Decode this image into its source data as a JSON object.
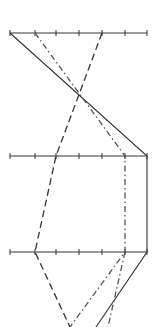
{
  "chart_data": {
    "type": "line",
    "subtype": "parallel-coordinates",
    "title": "",
    "xlabel": "",
    "ylabel": "",
    "grid": false,
    "legend": null,
    "axes": [
      {
        "name": "axis-1",
        "y": 33,
        "ticks": [
          10,
          35,
          56,
          79,
          102,
          125,
          147
        ]
      },
      {
        "name": "axis-2",
        "y": 156,
        "ticks": [
          10,
          35,
          56,
          79,
          102,
          125,
          147
        ]
      },
      {
        "name": "axis-3",
        "y": 252,
        "ticks": [
          10,
          35,
          56,
          79,
          102,
          125,
          147
        ]
      }
    ],
    "tick_count": 7,
    "series": [
      {
        "name": "solid",
        "style": "solid",
        "color": "#333333",
        "points": [
          [
            10,
            33
          ],
          [
            147,
            156
          ],
          [
            147,
            252
          ],
          [
            96,
            327
          ]
        ],
        "tick_index_values": [
          0,
          6,
          6
        ]
      },
      {
        "name": "dashed",
        "style": "dashed",
        "color": "#333333",
        "points": [
          [
            102,
            33
          ],
          [
            56,
            156
          ],
          [
            35,
            252
          ],
          [
            70,
            327
          ]
        ],
        "tick_index_values": [
          4,
          2,
          1
        ]
      },
      {
        "name": "dash-dot",
        "style": "dashdot",
        "color": "#555555",
        "points": [
          [
            35,
            33
          ],
          [
            125,
            156
          ],
          [
            125,
            252
          ],
          [
            70,
            327
          ]
        ],
        "tick_index_values": [
          1,
          5,
          5
        ]
      },
      {
        "name": "dash-dot-2",
        "style": "dashdot",
        "color": "#555555",
        "points": [
          [
            125,
            252
          ],
          [
            108,
            327
          ]
        ]
      }
    ]
  }
}
